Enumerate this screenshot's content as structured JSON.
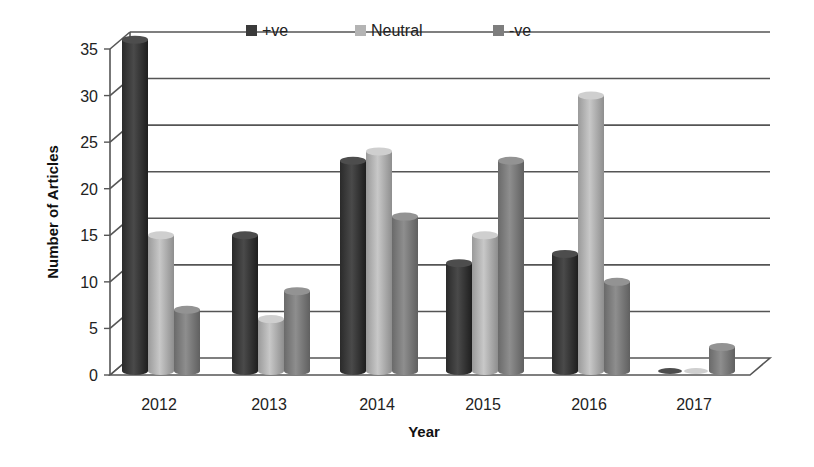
{
  "chart_data": {
    "type": "bar",
    "style": "3d-cylinder-clustered",
    "title": "",
    "xlabel": "Year",
    "ylabel": "Number of Articles",
    "categories": [
      "2012",
      "2013",
      "2014",
      "2015",
      "2016",
      "2017"
    ],
    "series": [
      {
        "name": "+ve",
        "color": "#3a3a3a",
        "values": [
          35,
          14,
          22,
          11,
          12,
          0
        ]
      },
      {
        "name": "Neutral",
        "color": "#b4b4b4",
        "values": [
          14,
          5,
          23,
          14,
          29,
          0
        ]
      },
      {
        "name": "-ve",
        "color": "#7e7e7e",
        "values": [
          6,
          8,
          16,
          22,
          9,
          2
        ]
      }
    ],
    "ylim": [
      0,
      35
    ],
    "yticks": [
      0,
      5,
      10,
      15,
      20,
      25,
      30,
      35
    ],
    "grid": true,
    "legend_position": "top-inside"
  },
  "axis": {
    "ytick_labels": [
      "0",
      "5",
      "10",
      "15",
      "20",
      "25",
      "30",
      "35"
    ]
  }
}
